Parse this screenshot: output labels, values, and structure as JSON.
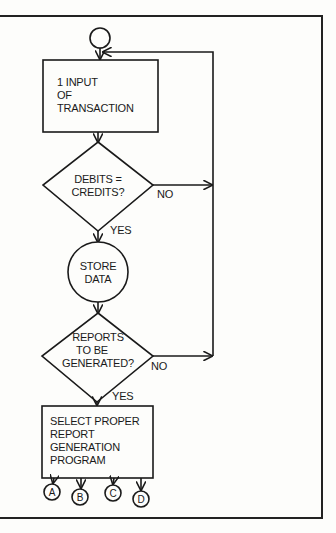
{
  "diagram": {
    "type": "flowchart",
    "start": {
      "shape": "circle",
      "label": ""
    },
    "nodes": [
      {
        "id": "input",
        "shape": "rectangle",
        "lines": [
          "1 INPUT",
          "OF",
          "TRANSACTION"
        ]
      },
      {
        "id": "balance-check",
        "shape": "diamond",
        "lines": [
          "DEBITS =",
          "CREDITS?"
        ]
      },
      {
        "id": "store",
        "shape": "circle",
        "lines": [
          "STORE",
          "DATA"
        ]
      },
      {
        "id": "reports-check",
        "shape": "diamond",
        "lines": [
          "REPORTS",
          "TO BE",
          "GENERATED?"
        ]
      },
      {
        "id": "select-program",
        "shape": "rectangle",
        "lines": [
          "SELECT PROPER",
          "REPORT",
          "GENERATION",
          "PROGRAM"
        ]
      }
    ],
    "edge_labels": {
      "balance_no": "NO",
      "balance_yes": "YES",
      "reports_no": "NO",
      "reports_yes": "YES"
    },
    "connectors": [
      "A",
      "B",
      "C",
      "D"
    ]
  }
}
